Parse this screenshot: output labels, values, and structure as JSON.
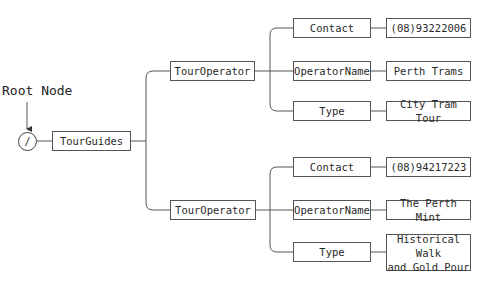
{
  "root_label": "Root Node",
  "root_symbol": "/",
  "root_element": "TourGuides",
  "operators": [
    {
      "label": "TourOperator",
      "children": [
        {
          "name": "Contact",
          "value": "(08)93222006"
        },
        {
          "name": "OperatorName",
          "value": "Perth Trams"
        },
        {
          "name": "Type",
          "value": "City Tram Tour"
        }
      ]
    },
    {
      "label": "TourOperator",
      "children": [
        {
          "name": "Contact",
          "value": "(08)94217223"
        },
        {
          "name": "OperatorName",
          "value": "The Perth Mint"
        },
        {
          "name": "Type",
          "value": "Historical Walk\nand Gold Pour"
        }
      ]
    }
  ]
}
